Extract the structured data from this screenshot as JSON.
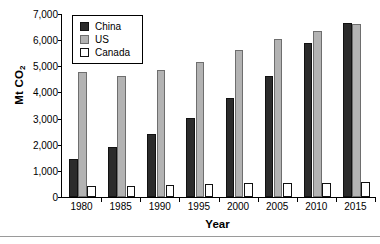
{
  "chart_data": {
    "type": "bar",
    "title": "",
    "subtitle": "",
    "xlabel": "Year",
    "ylabel": "Mt CO",
    "ylabel_subscript": "2",
    "categories": [
      "1980",
      "1985",
      "1990",
      "1995",
      "2000",
      "2005",
      "2010",
      "2015"
    ],
    "series": [
      {
        "name": "China",
        "color": "#2b2b2b",
        "values": [
          1450,
          1930,
          2420,
          3030,
          3800,
          4620,
          5880,
          6640
        ]
      },
      {
        "name": "US",
        "color": "#b3b3b3",
        "values": [
          4770,
          4620,
          4870,
          5150,
          5640,
          6060,
          6340,
          6620
        ]
      },
      {
        "name": "Canada",
        "color": "#ffffff",
        "values": [
          430,
          430,
          460,
          490,
          520,
          540,
          550,
          560
        ]
      }
    ],
    "ylim": [
      0,
      7000
    ],
    "yticks": [
      0,
      1000,
      2000,
      3000,
      4000,
      5000,
      6000,
      7000
    ],
    "ytick_labels": [
      "0",
      "1,000",
      "2,000",
      "3,000",
      "4,000",
      "5,000",
      "6,000",
      "7,000"
    ],
    "grid": false,
    "legend_position": "top-left",
    "legend_entries": [
      "China",
      "US",
      "Canada"
    ]
  },
  "axes": {
    "ylabel_text": "Mt CO",
    "ylabel_sub": "2",
    "xlabel_text": "Year"
  }
}
